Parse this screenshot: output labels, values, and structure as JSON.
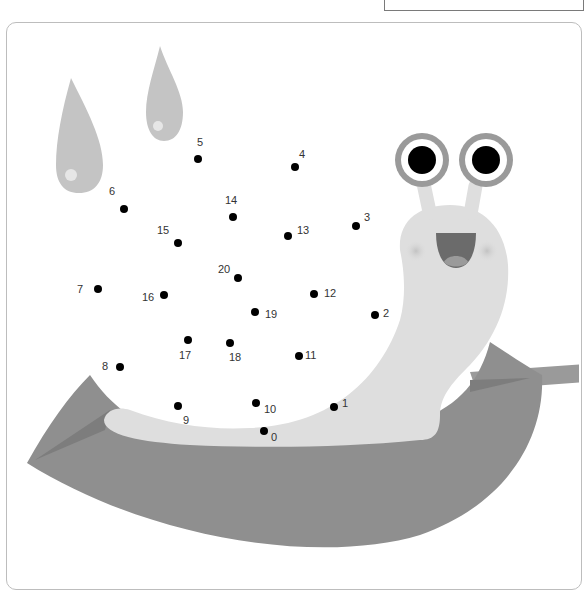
{
  "worksheet": {
    "name_box": "",
    "colors": {
      "frame_border": "#bdbdbd",
      "drop": "#c4c4c4",
      "drop_highlight": "#e6e6e6",
      "snail_body": "#dedede",
      "leaf": "#8f8f8f",
      "leaf_vein": "#7d7d7d",
      "eye_ring": "#9a9a9a",
      "pupil": "#000000",
      "mouth": "#6b6b6b",
      "tongue": "#9a9a9a",
      "dot": "#000000"
    },
    "dots": [
      {
        "n": "0",
        "x": 264,
        "y": 431,
        "lx": 271,
        "ly": 432
      },
      {
        "n": "1",
        "x": 334,
        "y": 407,
        "lx": 342,
        "ly": 398
      },
      {
        "n": "2",
        "x": 375,
        "y": 315,
        "lx": 383,
        "ly": 308
      },
      {
        "n": "3",
        "x": 356,
        "y": 226,
        "lx": 364,
        "ly": 212
      },
      {
        "n": "4",
        "x": 295,
        "y": 167,
        "lx": 299,
        "ly": 149
      },
      {
        "n": "5",
        "x": 198,
        "y": 159,
        "lx": 197,
        "ly": 137
      },
      {
        "n": "6",
        "x": 124,
        "y": 209,
        "lx": 109,
        "ly": 186
      },
      {
        "n": "7",
        "x": 98,
        "y": 289,
        "lx": 77,
        "ly": 284
      },
      {
        "n": "8",
        "x": 120,
        "y": 367,
        "lx": 102,
        "ly": 361
      },
      {
        "n": "9",
        "x": 178,
        "y": 406,
        "lx": 183,
        "ly": 415
      },
      {
        "n": "10",
        "x": 256,
        "y": 403,
        "lx": 264,
        "ly": 404
      },
      {
        "n": "11",
        "x": 299,
        "y": 356,
        "lx": 305,
        "ly": 350
      },
      {
        "n": "12",
        "x": 314,
        "y": 294,
        "lx": 324,
        "ly": 288
      },
      {
        "n": "13",
        "x": 288,
        "y": 236,
        "lx": 297,
        "ly": 225
      },
      {
        "n": "14",
        "x": 233,
        "y": 217,
        "lx": 225,
        "ly": 195
      },
      {
        "n": "15",
        "x": 178,
        "y": 243,
        "lx": 157,
        "ly": 225
      },
      {
        "n": "16",
        "x": 164,
        "y": 295,
        "lx": 142,
        "ly": 292
      },
      {
        "n": "17",
        "x": 188,
        "y": 340,
        "lx": 179,
        "ly": 350
      },
      {
        "n": "18",
        "x": 230,
        "y": 343,
        "lx": 229,
        "ly": 352
      },
      {
        "n": "19",
        "x": 255,
        "y": 312,
        "lx": 265,
        "ly": 309
      },
      {
        "n": "20",
        "x": 238,
        "y": 278,
        "lx": 218,
        "ly": 264
      }
    ]
  }
}
